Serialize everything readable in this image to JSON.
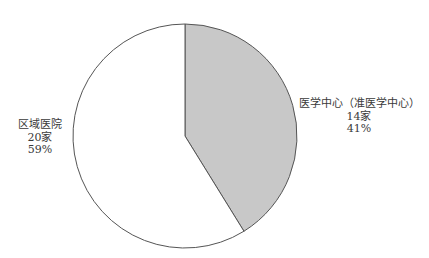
{
  "chart_data": {
    "type": "pie",
    "title": "",
    "start_angle": "12 o'clock",
    "direction": "clockwise",
    "slices": [
      {
        "label": "医学中心（准医学中心）",
        "count_label": "14家",
        "value": 14,
        "percent_label": "41%",
        "percent": 41,
        "color": "#c8c8c8"
      },
      {
        "label": "区域医院",
        "count_label": "20家",
        "value": 20,
        "percent_label": "59%",
        "percent": 59,
        "color": "#ffffff"
      }
    ],
    "stroke_color": "#555555",
    "legend": "none (direct labels)"
  },
  "labels": {
    "right": {
      "line1": "医学中心（准医学中心）",
      "line2": "14家",
      "line3": "41%"
    },
    "left": {
      "line1": "区域医院",
      "line2": "20家",
      "line3": "59%"
    }
  }
}
